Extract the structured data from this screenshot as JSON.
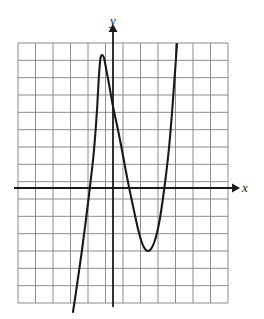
{
  "figure": {
    "title": "",
    "background_color": "#ffffff",
    "axis_color": "#1a1a1a",
    "grid_color": "#808080",
    "curve_color": "#1a1a1a"
  },
  "axes": {
    "x_label": "x",
    "y_label": "y",
    "x_axis_pixel_y": 188,
    "y_axis_pixel_x": 113
  },
  "grid": {
    "left": 18,
    "top": 43,
    "right": 228,
    "bottom": 303,
    "columns": 12,
    "rows": 15,
    "cell_width": 17.5,
    "cell_height": 17.33
  },
  "chart_data": {
    "type": "line",
    "title": "",
    "xlabel": "x",
    "ylabel": "y",
    "grid": true,
    "legend": null,
    "xlim": [
      -5.43,
      6.57
    ],
    "ylim": [
      -6.63,
      8.37
    ],
    "x_tick_labels": [],
    "y_tick_labels": [],
    "features": {
      "local_maximum": {
        "x": -0.74,
        "y": 7.56
      },
      "local_minimum": {
        "x": 1.94,
        "y": -3.58
      },
      "x_intercepts": [
        -1.89,
        0.74,
        3.14
      ],
      "y_intercept": 5.8
    },
    "series": [
      {
        "name": "cubic curve",
        "points_pixel": [
          [
            73,
            312
          ],
          [
            76,
            292
          ],
          [
            79,
            271
          ],
          [
            82,
            250
          ],
          [
            85,
            227
          ],
          [
            88,
            203
          ],
          [
            91,
            178
          ],
          [
            94,
            150
          ],
          [
            97,
            110
          ],
          [
            99,
            75
          ],
          [
            100.5,
            58
          ],
          [
            102,
            55
          ],
          [
            104,
            58
          ],
          [
            106,
            68
          ],
          [
            109,
            84
          ],
          [
            112,
            101
          ],
          [
            115,
            116
          ],
          [
            118,
            130
          ],
          [
            121,
            145
          ],
          [
            124,
            161
          ],
          [
            127,
            177
          ],
          [
            130,
            192
          ],
          [
            133,
            206
          ],
          [
            136,
            220
          ],
          [
            139,
            233
          ],
          [
            142,
            243
          ],
          [
            145,
            249
          ],
          [
            148,
            251
          ],
          [
            151,
            249
          ],
          [
            154,
            243
          ],
          [
            157,
            233
          ],
          [
            160,
            218
          ],
          [
            163,
            198
          ],
          [
            166,
            175
          ],
          [
            169,
            148
          ],
          [
            172,
            113
          ],
          [
            175,
            72
          ],
          [
            177,
            44
          ]
        ]
      }
    ]
  }
}
